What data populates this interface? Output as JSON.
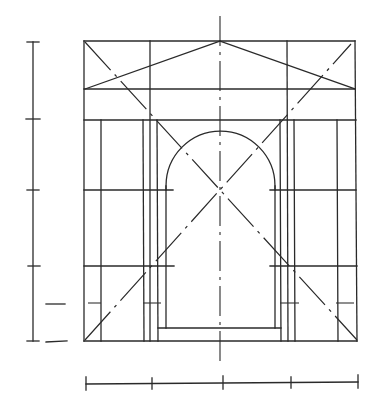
{
  "drawing": {
    "title": "",
    "subject": "arched portal elevation with pediment - proportional construction",
    "line_color": "#2a2a2a",
    "background": "#ffffff",
    "scale_bars": {
      "vertical": {
        "divisions": 4
      },
      "horizontal": {
        "divisions": 4
      }
    },
    "elements": [
      "outer-frame",
      "pediment",
      "entablature",
      "left-piers",
      "right-piers",
      "arch-opening",
      "diagonals",
      "centerline",
      "dimension-scales"
    ]
  }
}
